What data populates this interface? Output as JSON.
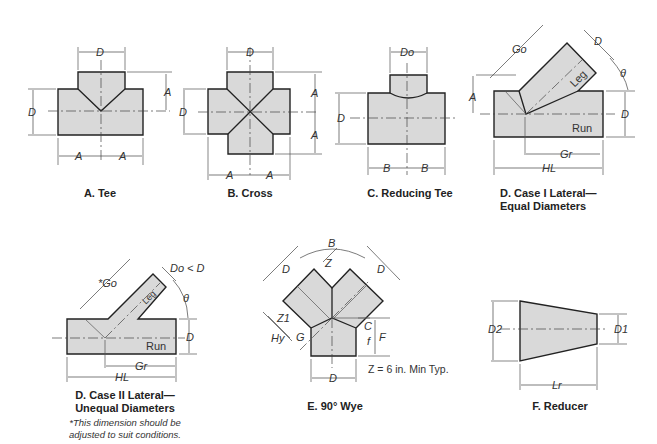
{
  "figures": {
    "tee": {
      "caption": "A. Tee",
      "labels": {
        "D_top": "D",
        "D_left": "D",
        "A_right": "A",
        "A_left": "A",
        "A_right2": "A"
      }
    },
    "cross": {
      "caption": "B. Cross",
      "labels": {
        "D_top": "D",
        "D_left": "D",
        "A_top": "A",
        "A_bottom": "A",
        "A_left": "A",
        "A_right": "A"
      }
    },
    "reducing_tee": {
      "caption": "C. Reducing Tee",
      "labels": {
        "Do": "Do",
        "D": "D",
        "A": "A",
        "B_left": "B",
        "B_right": "B"
      }
    },
    "lateral_case1": {
      "caption_line1": "D. Case I Lateral—",
      "caption_line2": "Equal Diameters",
      "labels": {
        "Go": "Go",
        "D_top": "D",
        "theta": "θ",
        "D_right": "D",
        "leg": "Leg",
        "run": "Run",
        "Gr": "Gr",
        "HL": "HL"
      }
    },
    "lateral_case2": {
      "caption_line1": "D. Case II Lateral—",
      "caption_line2": "Unequal Diameters",
      "note_line1": "*This dimension should be",
      "note_line2": "adjusted to suit conditions.",
      "labels": {
        "Go": "*Go",
        "DoD": "Do < D",
        "theta": "θ",
        "D": "D",
        "leg": "Leg",
        "run": "Run",
        "Gr": "Gr",
        "HL": "HL"
      }
    },
    "wye": {
      "caption": "E. 90° Wye",
      "note": "Z = 6 in. Min Typ.",
      "labels": {
        "B": "B",
        "D_left": "D",
        "D_right": "D",
        "Z": "Z",
        "Z1": "Z1",
        "Hy": "Hy",
        "G": "G",
        "C": "C",
        "f": "f",
        "F": "F",
        "D_bottom": "D"
      }
    },
    "reducer": {
      "caption": "F. Reducer",
      "labels": {
        "D2": "D2",
        "D1": "D1",
        "Lr": "Lr"
      }
    }
  },
  "colors": {
    "fill": "#d9d9d9",
    "stroke": "#222222"
  }
}
